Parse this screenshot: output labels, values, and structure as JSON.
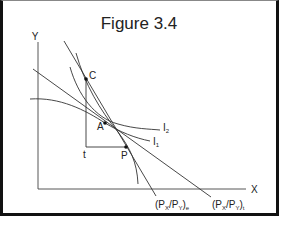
{
  "figure": {
    "title": "Figure 3.4",
    "axes": {
      "y_label": "Y",
      "x_label": "X"
    },
    "points": [
      {
        "id": "C",
        "label": "C"
      },
      {
        "id": "A",
        "label": "A"
      },
      {
        "id": "P",
        "label": "P"
      },
      {
        "id": "t",
        "label": "t"
      }
    ],
    "curves": [
      {
        "id": "I2",
        "label": "I",
        "subscript": "2"
      },
      {
        "id": "I1",
        "label": "I",
        "subscript": "1"
      }
    ],
    "price_lines": [
      {
        "id": "e",
        "label_main": "(P",
        "sub1": "X",
        "mid": "/P",
        "sub2": "Y",
        "close": ")",
        "sub3": "e"
      },
      {
        "id": "t",
        "label_main": "(P",
        "sub1": "X",
        "mid": "/P",
        "sub2": "Y",
        "close": ")",
        "sub3": "t"
      }
    ]
  },
  "colors": {
    "line": "#333333",
    "border": "#111111",
    "background": "#ffffff"
  }
}
